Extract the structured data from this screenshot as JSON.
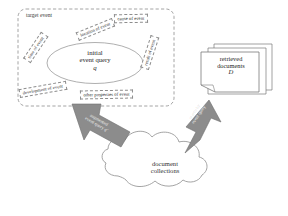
{
  "figure": {
    "target_box_label": "target event",
    "query_ellipse": {
      "line1": "initial",
      "line2": "event query",
      "symbol": "q"
    },
    "facets": [
      {
        "id": "time",
        "label": "time of event"
      },
      {
        "id": "location",
        "label": "location of event"
      },
      {
        "id": "cause",
        "label": "cause of event"
      },
      {
        "id": "result",
        "label": "result of event"
      },
      {
        "id": "development",
        "label": "development of event"
      },
      {
        "id": "other",
        "label": "other properties of event"
      }
    ],
    "documents": {
      "line1": "retrieved",
      "line2": "documents",
      "symbol": "D"
    },
    "cloud": {
      "line1": "document",
      "line2": "collections"
    },
    "arrows": {
      "left": {
        "line1": "augmented",
        "line2": "event query",
        "symbol": "q'"
      },
      "right": {
        "line1": "search by",
        "line2": "event query"
      }
    }
  },
  "colors": {
    "arrow_fill": "#8c8c8c",
    "arrow_stroke": "#6e6e6e",
    "cloud_stroke": "#9a9a9a",
    "dash_stroke": "#8d8d8d",
    "doc_stroke": "#7a7a7a",
    "text": "#262626",
    "background": "#ffffff"
  }
}
